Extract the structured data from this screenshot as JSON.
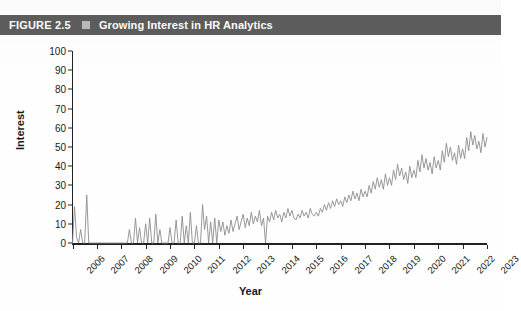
{
  "figure": {
    "label": "FIGURE 2.5",
    "marker": "square-marker",
    "title": "Growing Interest in HR Analytics"
  },
  "colors": {
    "banner_background": "#5d5d5d",
    "banner_text": "#ffffff",
    "banner_marker": "#b9b9b9",
    "line": "#8d8d8d",
    "axis": "#222222",
    "page_background": "#ffffff"
  },
  "chart_data": {
    "type": "line",
    "title": "Growing Interest in HR Analytics",
    "subtitle": "",
    "xlabel": "Year",
    "ylabel": "Interest",
    "ylim": [
      0,
      100
    ],
    "xlim": [
      2006,
      2023
    ],
    "yticks": [
      0,
      10,
      20,
      30,
      40,
      50,
      60,
      70,
      80,
      90,
      100
    ],
    "ytick_labels": [
      "0",
      "10",
      "20",
      "30",
      "40",
      "50",
      "60",
      "70",
      "80",
      "90",
      "100"
    ],
    "xticks": [
      2006,
      2007,
      2008,
      2009,
      2010,
      2011,
      2012,
      2013,
      2014,
      2015,
      2016,
      2017,
      2018,
      2019,
      2020,
      2021,
      2022,
      2023
    ],
    "xtick_labels": [
      "2006",
      "2007",
      "2008",
      "2009",
      "2010",
      "2011",
      "2012",
      "2013",
      "2014",
      "2015",
      "2016",
      "2017",
      "2018",
      "2019",
      "2020",
      "2021",
      "2022",
      "2023"
    ],
    "grid": false,
    "legend": false,
    "legend_position": "none",
    "annotations": [],
    "series": [
      {
        "name": "Interest",
        "color": "#8d8d8d",
        "x_start": 2006.0,
        "x_step": 0.08333333,
        "values": [
          0,
          19,
          3,
          0,
          7,
          0,
          0,
          25,
          0,
          0,
          0,
          0,
          0,
          0,
          0,
          0,
          0,
          0,
          0,
          0,
          0,
          0,
          0,
          0,
          0,
          0,
          0,
          0,
          7,
          0,
          0,
          13,
          0,
          8,
          0,
          0,
          10,
          0,
          13,
          0,
          0,
          15,
          0,
          7,
          0,
          0,
          0,
          0,
          8,
          0,
          0,
          12,
          0,
          0,
          14,
          0,
          9,
          0,
          16,
          0,
          0,
          9,
          0,
          0,
          20,
          7,
          14,
          0,
          11,
          0,
          13,
          0,
          12,
          6,
          11,
          4,
          9,
          5,
          12,
          6,
          10,
          14,
          7,
          11,
          15,
          8,
          13,
          9,
          16,
          10,
          14,
          11,
          17,
          9,
          13,
          0,
          14,
          11,
          16,
          12,
          17,
          13,
          15,
          11,
          16,
          13,
          18,
          14,
          17,
          13,
          12,
          15,
          13,
          17,
          14,
          16,
          13,
          18,
          15,
          14,
          16,
          14,
          18,
          16,
          20,
          17,
          21,
          18,
          22,
          19,
          23,
          20,
          22,
          19,
          24,
          21,
          25,
          22,
          27,
          23,
          26,
          22,
          28,
          24,
          27,
          24,
          30,
          26,
          32,
          28,
          34,
          29,
          33,
          28,
          36,
          30,
          34,
          30,
          38,
          33,
          41,
          35,
          39,
          33,
          37,
          31,
          40,
          34,
          38,
          34,
          43,
          37,
          46,
          39,
          44,
          38,
          42,
          36,
          45,
          39,
          43,
          38,
          48,
          42,
          52,
          45,
          50,
          43,
          47,
          41,
          51,
          44,
          49,
          44,
          55,
          48,
          58,
          51,
          56,
          49,
          53,
          47,
          57,
          50,
          55,
          50,
          61,
          54,
          64,
          57,
          62,
          55,
          59,
          53,
          63,
          57,
          61,
          56,
          67,
          60,
          71,
          63,
          68,
          61,
          65,
          58,
          70,
          63,
          68,
          62,
          75,
          68,
          79,
          71,
          90,
          68,
          66,
          62,
          72,
          68,
          74,
          70,
          78,
          73,
          81,
          75,
          79,
          73,
          71,
          66,
          77,
          72,
          76,
          70,
          82,
          76,
          86,
          79,
          83,
          77,
          80,
          74,
          70,
          78,
          84,
          78,
          88,
          82,
          92,
          85,
          89,
          83,
          86,
          80,
          94,
          87,
          91,
          85,
          97,
          90,
          100,
          93,
          88,
          85
        ]
      }
    ]
  }
}
